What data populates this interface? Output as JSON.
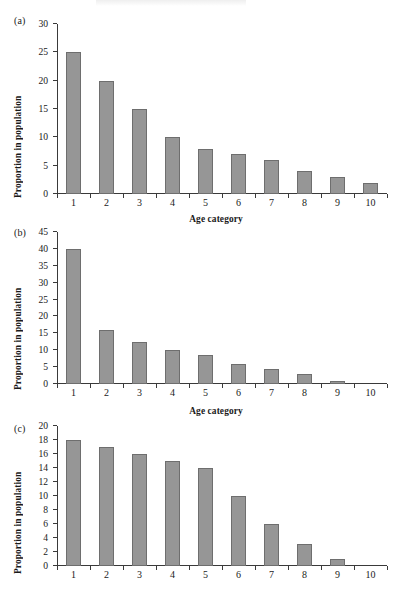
{
  "figure": {
    "background_color": "#ffffff",
    "bar_color": "#969696",
    "bar_edge_color": "#6e6e6e",
    "axis_color": "#3a3a3a"
  },
  "panels": [
    {
      "tag": "(a)",
      "ylabel": "Proportion in population",
      "xlabel": "Age category"
    },
    {
      "tag": "(b)",
      "ylabel": "Proportion in population",
      "xlabel": "Age category"
    },
    {
      "tag": "(c)",
      "ylabel": "Proportion in population",
      "xlabel": ""
    }
  ],
  "chart_data": [
    {
      "type": "bar",
      "title": "(a)",
      "categories": [
        "1",
        "2",
        "3",
        "4",
        "5",
        "6",
        "7",
        "8",
        "9",
        "10"
      ],
      "values": [
        25,
        20,
        15,
        10,
        8,
        7,
        6,
        4,
        3,
        2
      ],
      "xlabel": "Age category",
      "ylabel": "Proportion in population",
      "ylim": [
        0,
        30
      ],
      "ytick_step": 5,
      "yticks": [
        0,
        5,
        10,
        15,
        20,
        25,
        30
      ],
      "grid": false,
      "legend": false
    },
    {
      "type": "bar",
      "title": "(b)",
      "categories": [
        "1",
        "2",
        "3",
        "4",
        "5",
        "6",
        "7",
        "8",
        "9",
        "10"
      ],
      "values": [
        40,
        16,
        12.5,
        10,
        8.5,
        6,
        4.5,
        3,
        0.8,
        0
      ],
      "xlabel": "Age category",
      "ylabel": "Proportion in population",
      "ylim": [
        0,
        45
      ],
      "ytick_step": 5,
      "yticks": [
        0,
        5,
        10,
        15,
        20,
        25,
        30,
        35,
        40,
        45
      ],
      "grid": false,
      "legend": false
    },
    {
      "type": "bar",
      "title": "(c)",
      "categories": [
        "1",
        "2",
        "3",
        "4",
        "5",
        "6",
        "7",
        "8",
        "9",
        "10"
      ],
      "values": [
        18,
        17,
        16,
        15,
        14,
        10,
        6,
        3.2,
        1,
        0
      ],
      "xlabel": "",
      "ylabel": "Proportion in population",
      "ylim": [
        0,
        20
      ],
      "ytick_step": 2,
      "yticks": [
        0,
        2,
        4,
        6,
        8,
        10,
        12,
        14,
        16,
        18,
        20
      ],
      "grid": false,
      "legend": false
    }
  ]
}
